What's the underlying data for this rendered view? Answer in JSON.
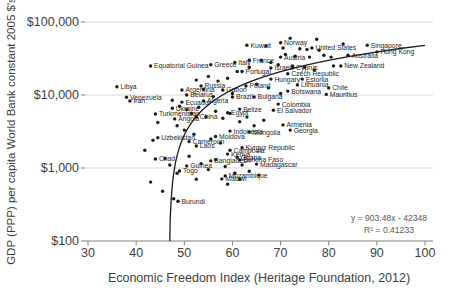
{
  "x_axis": {
    "title": "Economic Freedom Index (Heritage Foundation, 2012)",
    "ticks": [
      30,
      40,
      50,
      60,
      70,
      80,
      90,
      100
    ],
    "min": 30,
    "max": 100
  },
  "y_axis": {
    "title": "GDP (PPP) per capita World Bank constant 2005 $'s",
    "ticks": [
      {
        "value": 100,
        "label": "$100"
      },
      {
        "value": 1000,
        "label": "$1,000"
      },
      {
        "value": 10000,
        "label": "$10,000"
      },
      {
        "value": 100000,
        "label": "$100,000"
      }
    ],
    "scale": "log"
  },
  "trend": {
    "equation": "y = 903.48x - 42348",
    "r_squared": "R² = 0.41233",
    "slope": 903.48,
    "intercept": -42348
  },
  "colors": {
    "dot": "#1a1a1a",
    "trend_line": "#1a1a1a",
    "gridline": "#d9d9d9",
    "axis": "#808080",
    "tick_text": "#404040",
    "label_text": "#262626",
    "annotation_text": "#595959",
    "background": "#ffffff"
  },
  "chart_data": {
    "type": "scatter",
    "title": "",
    "xlabel": "Economic Freedom Index (Heritage Foundation, 2012)",
    "ylabel": "GDP (PPP) per capita World Bank constant 2005 $'s",
    "xlim": [
      30,
      100
    ],
    "ylim": [
      100,
      100000
    ],
    "y_scale": "log",
    "grid": "horizontal",
    "trendline": {
      "type": "linear",
      "equation": "y = 903.48x - 42348",
      "r2": 0.41233
    },
    "points": [
      {
        "label": "Libya",
        "x": 36,
        "y": 13000
      },
      {
        "label": "Venezuela",
        "x": 38,
        "y": 9300
      },
      {
        "label": "Iran",
        "x": 38.7,
        "y": 8300
      },
      {
        "label": "Equatorial Guinea",
        "x": 43,
        "y": 25000
      },
      {
        "label": "Greece",
        "x": 55.5,
        "y": 26000
      },
      {
        "label": "Italy",
        "x": 60.5,
        "y": 28000
      },
      {
        "label": "Kuwait",
        "x": 63,
        "y": 48000
      },
      {
        "label": "Norway",
        "x": 70,
        "y": 52000
      },
      {
        "label": "United States",
        "x": 76.5,
        "y": 44000
      },
      {
        "label": "Singapore",
        "x": 88,
        "y": 48000
      },
      {
        "label": "Hong Kong",
        "x": 90,
        "y": 39000
      },
      {
        "label": "Australia",
        "x": 84,
        "y": 35000
      },
      {
        "label": "New Zealand",
        "x": 82.5,
        "y": 25000
      },
      {
        "label": "France",
        "x": 63.5,
        "y": 30000
      },
      {
        "label": "Austria",
        "x": 70,
        "y": 33000
      },
      {
        "label": "Portugal",
        "x": 62,
        "y": 21000
      },
      {
        "label": "Israel",
        "x": 68,
        "y": 23500
      },
      {
        "label": "Cyprus",
        "x": 72.5,
        "y": 23500
      },
      {
        "label": "Czech Republic",
        "x": 71.5,
        "y": 19500
      },
      {
        "label": "Hungary",
        "x": 68,
        "y": 16500
      },
      {
        "label": "Estonia",
        "x": 74.5,
        "y": 16500
      },
      {
        "label": "Poland",
        "x": 62.8,
        "y": 13300
      },
      {
        "label": "Lithuania",
        "x": 73.5,
        "y": 13700
      },
      {
        "label": "Botswana",
        "x": 71.5,
        "y": 11300
      },
      {
        "label": "Chile",
        "x": 80,
        "y": 12500
      },
      {
        "label": "Mauritius",
        "x": 79.5,
        "y": 10200
      },
      {
        "label": "Bulgaria",
        "x": 64.5,
        "y": 9400
      },
      {
        "label": "Brazil",
        "x": 60,
        "y": 9400
      },
      {
        "label": "Gabon",
        "x": 58,
        "y": 11700
      },
      {
        "label": "Argentina",
        "x": 49.5,
        "y": 11700
      },
      {
        "label": "Russia",
        "x": 53.5,
        "y": 13300
      },
      {
        "label": "Belarus",
        "x": 50.5,
        "y": 10000
      },
      {
        "label": "Ecuador",
        "x": 49.5,
        "y": 8000
      },
      {
        "label": "Algeria",
        "x": 54,
        "y": 8300
      },
      {
        "label": "Ukraine",
        "x": 47.5,
        "y": 6600
      },
      {
        "label": "Turkmenistan",
        "x": 44,
        "y": 5500
      },
      {
        "label": "Angola",
        "x": 48,
        "y": 4700
      },
      {
        "label": "China",
        "x": 52.5,
        "y": 5000
      },
      {
        "label": "Egypt",
        "x": 59,
        "y": 5700
      },
      {
        "label": "Belize",
        "x": 61.5,
        "y": 6400
      },
      {
        "label": "Colombia",
        "x": 69.5,
        "y": 7500
      },
      {
        "label": "El Salvador",
        "x": 68.5,
        "y": 6200
      },
      {
        "label": "Armenia",
        "x": 70.5,
        "y": 3900
      },
      {
        "label": "Georgia",
        "x": 72,
        "y": 3300
      },
      {
        "label": "Indonesia",
        "x": 59.5,
        "y": 3200
      },
      {
        "label": "Mongolia",
        "x": 63.5,
        "y": 3100
      },
      {
        "label": "Moldova",
        "x": 56.5,
        "y": 2700
      },
      {
        "label": "Uzbekistan",
        "x": 44.5,
        "y": 2600
      },
      {
        "label": "Cameroon",
        "x": 51,
        "y": 2300
      },
      {
        "label": "Laos",
        "x": 52.5,
        "y": 2000
      },
      {
        "label": "Kyrgyz Republic",
        "x": 62,
        "y": 1900
      },
      {
        "label": "Cambodia",
        "x": 59.5,
        "y": 1750
      },
      {
        "label": "Kenya",
        "x": 59,
        "y": 1550
      },
      {
        "label": "Ghana",
        "x": 61,
        "y": 1400
      },
      {
        "label": "Bangladesh",
        "x": 55.5,
        "y": 1250
      },
      {
        "label": "Burkina Faso",
        "x": 61.5,
        "y": 1290
      },
      {
        "label": "Madagascar",
        "x": 65,
        "y": 1130
      },
      {
        "label": "Guinea",
        "x": 50.5,
        "y": 1070
      },
      {
        "label": "Chad",
        "x": 44,
        "y": 1330
      },
      {
        "label": "Togo",
        "x": 49,
        "y": 910
      },
      {
        "label": "Mozambique",
        "x": 58.5,
        "y": 780
      },
      {
        "label": "Malawi",
        "x": 57.8,
        "y": 710
      },
      {
        "label": "Burundi",
        "x": 48.7,
        "y": 350
      }
    ],
    "unlabeled_points": [
      [
        72,
        60000
      ],
      [
        77.5,
        58000
      ],
      [
        67,
        47000
      ],
      [
        70.5,
        44000
      ],
      [
        74,
        43000
      ],
      [
        75.5,
        42000
      ],
      [
        78,
        41000
      ],
      [
        83,
        50000
      ],
      [
        71,
        36000
      ],
      [
        73,
        34000
      ],
      [
        76,
        33000
      ],
      [
        79,
        35000
      ],
      [
        80.5,
        33000
      ],
      [
        66,
        30000
      ],
      [
        68,
        28000
      ],
      [
        69.5,
        26000
      ],
      [
        72.5,
        25000
      ],
      [
        75,
        24000
      ],
      [
        77,
        22000
      ],
      [
        81,
        25000
      ],
      [
        63.5,
        24000
      ],
      [
        61,
        21000
      ],
      [
        59,
        17000
      ],
      [
        57,
        15500
      ],
      [
        55,
        18000
      ],
      [
        52.5,
        16000
      ],
      [
        65,
        14000
      ],
      [
        67.5,
        12500
      ],
      [
        70,
        10500
      ],
      [
        60,
        10500
      ],
      [
        56,
        9500
      ],
      [
        54,
        12000
      ],
      [
        47.5,
        8500
      ],
      [
        49,
        7000
      ],
      [
        50.5,
        6300
      ],
      [
        51.5,
        5600
      ],
      [
        53,
        6800
      ],
      [
        54.5,
        5000
      ],
      [
        56.5,
        6000
      ],
      [
        58,
        4800
      ],
      [
        59.5,
        5600
      ],
      [
        61.5,
        4300
      ],
      [
        63,
        5000
      ],
      [
        64.5,
        3800
      ],
      [
        66.5,
        4500
      ],
      [
        48.5,
        3800
      ],
      [
        50,
        3300
      ],
      [
        52,
        2900
      ],
      [
        55.5,
        2500
      ],
      [
        57.5,
        2200
      ],
      [
        44.5,
        4200
      ],
      [
        43.5,
        2400
      ],
      [
        41.8,
        1750
      ],
      [
        46,
        1350
      ],
      [
        47,
        1100
      ],
      [
        48.5,
        850
      ],
      [
        51,
        1450
      ],
      [
        53.5,
        1150
      ],
      [
        55,
        950
      ],
      [
        56.5,
        1300
      ],
      [
        58.5,
        1050
      ],
      [
        60.5,
        850
      ],
      [
        62,
        1100
      ],
      [
        43,
        640
      ],
      [
        45.5,
        480
      ],
      [
        47.8,
        380
      ],
      [
        52.5,
        700
      ],
      [
        59,
        600
      ],
      [
        61.5,
        700
      ],
      [
        63.5,
        900
      ],
      [
        65.5,
        800
      ]
    ]
  }
}
